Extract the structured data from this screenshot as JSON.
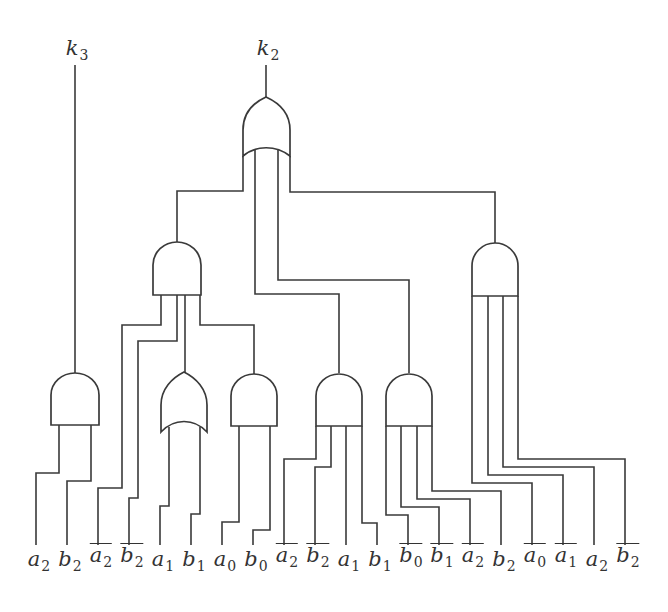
{
  "diagram": {
    "type": "logic-circuit",
    "outputs": [
      {
        "id": "k3",
        "var": "k",
        "sub": "3",
        "x": 75
      },
      {
        "id": "k2",
        "var": "k",
        "sub": "2",
        "x": 266
      }
    ],
    "inputs": [
      {
        "var": "a",
        "sub": "2",
        "negated": false,
        "x": 36
      },
      {
        "var": "b",
        "sub": "2",
        "negated": false,
        "x": 67
      },
      {
        "var": "a",
        "sub": "2",
        "negated": true,
        "x": 98
      },
      {
        "var": "b",
        "sub": "2",
        "negated": true,
        "x": 129
      },
      {
        "var": "a",
        "sub": "1",
        "negated": false,
        "x": 160
      },
      {
        "var": "b",
        "sub": "1",
        "negated": false,
        "x": 191
      },
      {
        "var": "a",
        "sub": "0",
        "negated": false,
        "x": 222
      },
      {
        "var": "b",
        "sub": "0",
        "negated": false,
        "x": 253
      },
      {
        "var": "a",
        "sub": "2",
        "negated": true,
        "x": 284
      },
      {
        "var": "b",
        "sub": "2",
        "negated": true,
        "x": 315
      },
      {
        "var": "a",
        "sub": "1",
        "negated": false,
        "x": 346
      },
      {
        "var": "b",
        "sub": "1",
        "negated": false,
        "x": 377
      },
      {
        "var": "b",
        "sub": "0",
        "negated": true,
        "x": 408
      },
      {
        "var": "b",
        "sub": "1",
        "negated": true,
        "x": 439
      },
      {
        "var": "a",
        "sub": "2",
        "negated": true,
        "x": 470
      },
      {
        "var": "b",
        "sub": "2",
        "negated": false,
        "x": 501
      },
      {
        "var": "a",
        "sub": "0",
        "negated": true,
        "x": 532
      },
      {
        "var": "a",
        "sub": "1",
        "negated": true,
        "x": 563
      },
      {
        "var": "a",
        "sub": "2",
        "negated": false,
        "x": 594
      },
      {
        "var": "b",
        "sub": "2",
        "negated": true,
        "x": 625
      }
    ],
    "gates": [
      {
        "id": "and-k3",
        "type": "AND",
        "inputs": [
          "a2",
          "b2"
        ],
        "output": "k3"
      },
      {
        "id": "or-a1b1",
        "type": "OR",
        "inputs": [
          "a1",
          "b1"
        ]
      },
      {
        "id": "and-a0b0",
        "type": "AND",
        "inputs": [
          "a0",
          "b0"
        ]
      },
      {
        "id": "and-mid",
        "type": "AND",
        "inputs": [
          "not a2",
          "not b2",
          "a1",
          "b1"
        ]
      },
      {
        "id": "and-b0b1",
        "type": "AND",
        "inputs": [
          "not b0",
          "not b1",
          "not a2",
          "b2"
        ]
      },
      {
        "id": "and-left-big",
        "type": "AND",
        "inputs": [
          "not a2",
          "not b2",
          "or-a1b1",
          "and-a0b0"
        ]
      },
      {
        "id": "and-right-big",
        "type": "AND",
        "inputs": [
          "not a0",
          "not a1",
          "a2",
          "not b2"
        ]
      },
      {
        "id": "or-k2",
        "type": "OR",
        "inputs": [
          "and-left-big",
          "and-mid",
          "and-b0b1",
          "and-right-big"
        ],
        "output": "k2"
      }
    ],
    "colors": {
      "stroke": "#3a3a3a",
      "background": "#ffffff",
      "text": "#333333"
    }
  }
}
